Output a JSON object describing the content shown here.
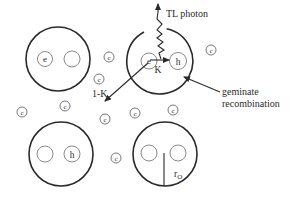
{
  "labels": {
    "tl_photon": "TL photon",
    "k": "K",
    "one_minus_k": "1-K",
    "geminate_line1": "geminate",
    "geminate_line2": "recombination",
    "radius": "r",
    "radius_sub": "O",
    "electron": "e",
    "hole": "h",
    "carrier": "c"
  },
  "cells": [
    {
      "name": "cell-top-left",
      "contents": [
        "e",
        ""
      ]
    },
    {
      "name": "cell-top-right",
      "contents": [
        "e",
        "h"
      ]
    },
    {
      "name": "cell-bottom-left",
      "contents": [
        "",
        "h"
      ]
    },
    {
      "name": "cell-bottom-right",
      "contents": [
        "",
        ""
      ]
    }
  ],
  "free_carriers_count": 8
}
